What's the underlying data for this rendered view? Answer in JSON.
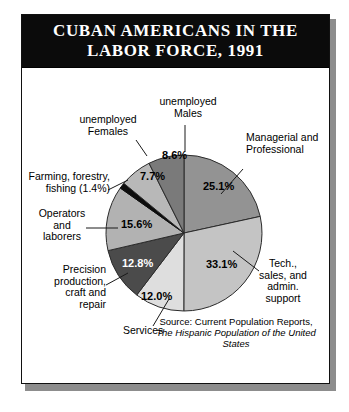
{
  "title": {
    "line1": "CUBAN AMERICANS IN THE",
    "line2": "LABOR FORCE, 1991"
  },
  "source": {
    "line1": "Source: Current Population Reports,",
    "line2": "The Hispanic Population of the United States"
  },
  "labels": {
    "managerial": "Managerial and\nProfessional",
    "tech_sales": "Tech.,\nsales, and\nadmin.\nsupport",
    "services": "Services",
    "precision": "Precision\nproduction,\ncraft and\nrepair",
    "operators": "Operators\nand\nlaborers",
    "farming": "Farming, forestry,\nfishing (1.4%)",
    "unemployed_females": "unemployed\nFemales",
    "unemployed_males": "unemployed\nMales"
  },
  "percent_labels": {
    "managerial": "25.1%",
    "tech_sales": "33.1%",
    "services": "12.0%",
    "precision": "12.8%",
    "operators": "15.6%",
    "unemployed_females": "7.7%",
    "unemployed_males": "8.6%"
  },
  "colors": {
    "banner_bg": "#0b0b0b",
    "banner_text": "#ffffff",
    "frame_border": "#111111",
    "page_bg": "#ffffff",
    "slice_managerial": "#939393",
    "slice_tech_sales": "#c4c4c4",
    "slice_services": "#dedede",
    "slice_precision": "#4b4b4b",
    "slice_operators": "#b2b2b2",
    "slice_farming": "#0d0d0d",
    "slice_unemployed_females": "#b8b8b8",
    "slice_unemployed_males": "#7a7a7a",
    "slice_outline": "#2b2b2b",
    "leader_line": "#1a1a1a"
  },
  "chart_data": {
    "type": "pie",
    "title": "CUBAN AMERICANS IN THE LABOR FORCE, 1991",
    "start_angle_deg": 0,
    "direction": "clockwise",
    "units": "percent",
    "legend": "none (direct labels with leader lines)",
    "total": 100.3,
    "categories": [
      "Managerial and Professional",
      "Tech., sales, and admin. support",
      "Services",
      "Precision production, craft and repair",
      "Operators and laborers",
      "Farming, forestry, fishing",
      "unemployed Females",
      "unemployed Males"
    ],
    "values": [
      25.1,
      33.1,
      12.0,
      12.8,
      15.6,
      1.4,
      7.7,
      8.6
    ],
    "slices": [
      {
        "label": "Managerial and Professional",
        "value": 25.1,
        "display": "25.1%",
        "color": "#939393"
      },
      {
        "label": "Tech., sales, and admin. support",
        "value": 33.1,
        "display": "33.1%",
        "color": "#c4c4c4"
      },
      {
        "label": "Services",
        "value": 12.0,
        "display": "12.0%",
        "color": "#dedede"
      },
      {
        "label": "Precision production, craft and repair",
        "value": 12.8,
        "display": "12.8%",
        "color": "#4b4b4b"
      },
      {
        "label": "Operators and laborers",
        "value": 15.6,
        "display": "15.6%",
        "color": "#b2b2b2"
      },
      {
        "label": "Farming, forestry, fishing",
        "value": 1.4,
        "display": "1.4%",
        "color": "#0d0d0d"
      },
      {
        "label": "unemployed Females",
        "value": 7.7,
        "display": "7.7%",
        "color": "#b8b8b8"
      },
      {
        "label": "unemployed Males",
        "value": 8.6,
        "display": "8.6%",
        "color": "#7a7a7a"
      }
    ],
    "source": "Source: Current Population Reports, The Hispanic Population of the United States"
  }
}
